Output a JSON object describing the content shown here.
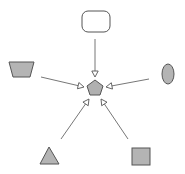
{
  "diagram": {
    "type": "hub-and-spoke",
    "colors": {
      "node_fill": "#b4b4b4",
      "node_stroke": "#555555",
      "hub_fill": "#b0b0b0",
      "plain_fill": "#ffffff",
      "edge": "#777777",
      "arrowhead_fill": "#ffffff"
    },
    "hub": {
      "id": "center",
      "shape": "pentagon"
    },
    "nodes": [
      {
        "id": "top",
        "shape": "rounded-rectangle",
        "filled": false
      },
      {
        "id": "left",
        "shape": "trapezoid",
        "filled": true
      },
      {
        "id": "right",
        "shape": "ellipse",
        "filled": true
      },
      {
        "id": "bottom-left",
        "shape": "triangle",
        "filled": true
      },
      {
        "id": "bottom-right",
        "shape": "square",
        "filled": true
      }
    ],
    "edges": [
      {
        "from": "top",
        "to": "center",
        "arrowhead": "open-triangle"
      },
      {
        "from": "left",
        "to": "center",
        "arrowhead": "open-triangle"
      },
      {
        "from": "right",
        "to": "center",
        "arrowhead": "open-triangle"
      },
      {
        "from": "bottom-left",
        "to": "center",
        "arrowhead": "open-triangle"
      },
      {
        "from": "bottom-right",
        "to": "center",
        "arrowhead": "open-triangle"
      }
    ]
  }
}
